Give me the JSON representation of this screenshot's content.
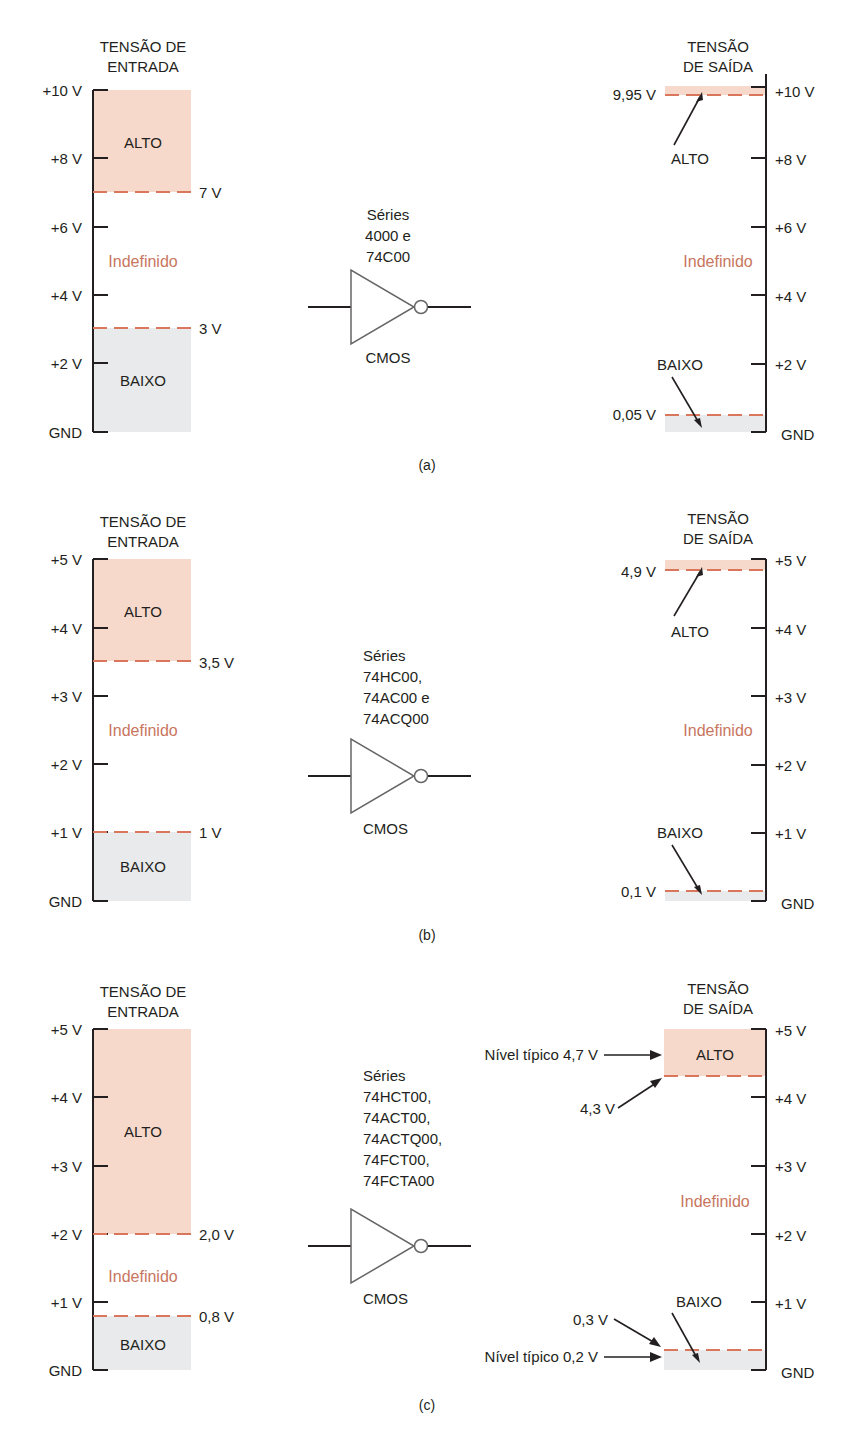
{
  "colors": {
    "high_fill": "#f7d9cb",
    "low_fill": "#e8eaeb",
    "dash": "#d9765c",
    "undefined_text": "#c8765e",
    "axis": "#231f20"
  },
  "panels": [
    {
      "caption": "(a)",
      "input": {
        "title_line1": "TENSÃO DE",
        "title_line2": "ENTRADA",
        "ticks": [
          "+10 V",
          "+8 V",
          "+6 V",
          "+4 V",
          "+2 V",
          "GND"
        ],
        "high_label": "ALTO",
        "undefined_label": "Indefinido",
        "low_label": "BAIXO",
        "high_threshold": "7 V",
        "low_threshold": "3 V"
      },
      "gate": {
        "series_lines": [
          "Séries",
          "4000 e",
          "74C00"
        ],
        "type_label": "CMOS"
      },
      "output": {
        "title_line1": "TENSÃO",
        "title_line2": "DE SAÍDA",
        "ticks": [
          "+10 V",
          "+8 V",
          "+6 V",
          "+4 V",
          "+2 V",
          "GND"
        ],
        "high_label": "ALTO",
        "undefined_label": "Indefinido",
        "low_label": "BAIXO",
        "high_threshold": "9,95 V",
        "low_threshold": "0,05 V"
      }
    },
    {
      "caption": "(b)",
      "input": {
        "title_line1": "TENSÃO DE",
        "title_line2": "ENTRADA",
        "ticks": [
          "+5 V",
          "+4 V",
          "+3 V",
          "+2 V",
          "+1 V",
          "GND"
        ],
        "high_label": "ALTO",
        "undefined_label": "Indefinido",
        "low_label": "BAIXO",
        "high_threshold": "3,5 V",
        "low_threshold": "1 V"
      },
      "gate": {
        "series_lines": [
          "Séries",
          "74HC00,",
          "74AC00 e",
          "74ACQ00"
        ],
        "type_label": "CMOS"
      },
      "output": {
        "title_line1": "TENSÃO",
        "title_line2": "DE SAÍDA",
        "ticks": [
          "+5 V",
          "+4 V",
          "+3 V",
          "+2 V",
          "+1 V",
          "GND"
        ],
        "high_label": "ALTO",
        "undefined_label": "Indefinido",
        "low_label": "BAIXO",
        "high_threshold": "4,9 V",
        "low_threshold": "0,1 V"
      }
    },
    {
      "caption": "(c)",
      "input": {
        "title_line1": "TENSÃO DE",
        "title_line2": "ENTRADA",
        "ticks": [
          "+5 V",
          "+4 V",
          "+3 V",
          "+2 V",
          "+1 V",
          "GND"
        ],
        "high_label": "ALTO",
        "undefined_label": "Indefinido",
        "low_label": "BAIXO",
        "high_threshold": "2,0 V",
        "low_threshold": "0,8 V"
      },
      "gate": {
        "series_lines": [
          "Séries",
          "74HCT00,",
          "74ACT00,",
          "74ACTQ00,",
          "74FCT00,",
          "74FCTA00"
        ],
        "type_label": "CMOS"
      },
      "output": {
        "title_line1": "TENSÃO",
        "title_line2": "DE SAÍDA",
        "ticks": [
          "+5 V",
          "+4 V",
          "+3 V",
          "+2 V",
          "+1 V",
          "GND"
        ],
        "high_label": "ALTO",
        "undefined_label": "Indefinido",
        "low_label": "BAIXO",
        "high_threshold": "4,3 V",
        "low_threshold": "0,3 V",
        "typical_high": "Nível típico 4,7 V",
        "typical_low": "Nível típico 0,2 V"
      }
    }
  ]
}
